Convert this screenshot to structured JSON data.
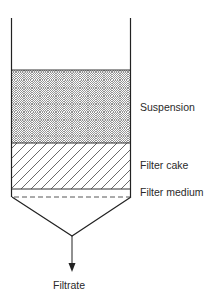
{
  "diagram": {
    "labels": {
      "suspension": "Suspension",
      "filter_cake": "Filter cake",
      "filter_medium": "Filter medium",
      "filtrate": "Filtrate"
    },
    "colors": {
      "line": "#222222",
      "hatch": "#555555",
      "background": "#ffffff"
    }
  }
}
